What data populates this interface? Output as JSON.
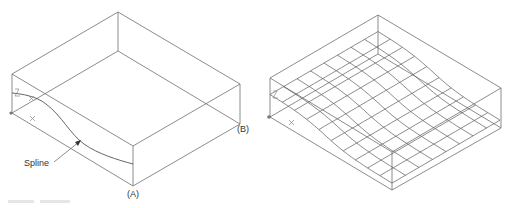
{
  "figure": {
    "left": {
      "name": "box-with-spline",
      "labels": {
        "spline": "Spline",
        "point_a": "(A)",
        "point_b": "(B)"
      },
      "ucs": {
        "z": "Z",
        "x": "X"
      }
    },
    "right": {
      "name": "box-with-surface-mesh",
      "ucs": {
        "z": "Z",
        "x": "X"
      }
    }
  },
  "colors": {
    "line": "#6e6e6e",
    "text": "#333333",
    "background": "#ffffff"
  }
}
